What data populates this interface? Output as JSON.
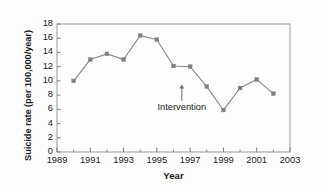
{
  "chart_data": {
    "type": "line",
    "title": "",
    "xlabel": "Year",
    "ylabel": "Suicide rate (per 100,000/year)",
    "xlim": [
      1989,
      2003
    ],
    "ylim": [
      0,
      18
    ],
    "xticks": [
      1989,
      1991,
      1993,
      1995,
      1997,
      1999,
      2001,
      2003
    ],
    "xtick_labels": [
      "1989",
      "1991",
      "1993",
      "1995",
      "1997",
      "1999",
      "2001",
      "2003"
    ],
    "yticks": [
      0,
      2,
      4,
      6,
      8,
      10,
      12,
      14,
      16,
      18
    ],
    "ytick_labels": [
      "0",
      "2",
      "4",
      "6",
      "8",
      "10",
      "12",
      "14",
      "16",
      "18"
    ],
    "minor_xticks": [
      1990,
      1992,
      1994,
      1996,
      1998,
      2000,
      2002
    ],
    "grid": false,
    "legend": null,
    "marker": "square",
    "series_color": "#808080",
    "line_color": "#888888",
    "x": [
      1990,
      1991,
      1992,
      1993,
      1994,
      1995,
      1996,
      1997,
      1998,
      1999,
      2000,
      2001,
      2002
    ],
    "values": [
      10.0,
      13.0,
      13.8,
      13.0,
      16.4,
      15.8,
      12.1,
      12.0,
      9.2,
      5.9,
      9.0,
      10.2,
      8.2
    ],
    "series": [
      {
        "name": "Suicide rate",
        "values": [
          10.0,
          13.0,
          13.8,
          13.0,
          16.4,
          15.8,
          12.1,
          12.0,
          9.2,
          5.9,
          9.0,
          10.2,
          8.2
        ]
      }
    ],
    "annotations": [
      {
        "text": "Intervention",
        "x": 1996.5,
        "y": 7.2,
        "arrow": "up",
        "arrow_tip_y": 9.4
      }
    ]
  }
}
